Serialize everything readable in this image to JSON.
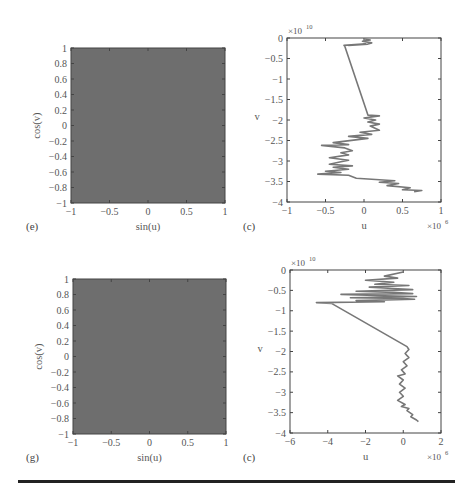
{
  "chart_data": [
    {
      "id": "e",
      "panel_label": "(e)",
      "type": "heatmap",
      "description": "Densely filled square (uniform gray) — points (sin(u), cos(v)) covering the whole square",
      "xlabel": "sin(u)",
      "ylabel": "cos(v)",
      "xlim": [
        -1,
        1
      ],
      "ylim": [
        -1,
        1
      ],
      "xticks": [
        -1,
        -0.5,
        0,
        0.5,
        1
      ],
      "xtick_labels": [
        "−1",
        "−0.5",
        "0",
        "0.5",
        "1"
      ],
      "yticks": [
        1,
        0.8,
        0.6,
        0.4,
        0.2,
        0,
        -0.2,
        -0.4,
        -0.6,
        -0.8,
        -1
      ],
      "ytick_labels": [
        "1",
        "0.8",
        "0.6",
        "0.4",
        "0.2",
        "0",
        "−0.2",
        "−0.4",
        "−0.6",
        "−0.8",
        "−1"
      ],
      "fill_color": "#6e6e6e",
      "frame": {
        "x": 71,
        "y": 48,
        "w": 154,
        "h": 155
      }
    },
    {
      "id": "c1",
      "panel_label": "(c)",
      "type": "line",
      "xlabel": "u",
      "ylabel": "v",
      "x_multiplier": "×10",
      "x_multiplier_exp": "6",
      "y_multiplier": "×10",
      "y_multiplier_exp": "10",
      "xlim": [
        -1,
        1
      ],
      "ylim": [
        -4,
        0
      ],
      "xticks": [
        -1,
        -0.5,
        0,
        0.5,
        1
      ],
      "xtick_labels": [
        "−1",
        "−0.5",
        "0",
        "0.5",
        "1"
      ],
      "yticks": [
        0,
        -0.5,
        -1,
        -1.5,
        -2,
        -2.5,
        -3,
        -3.5,
        -4
      ],
      "ytick_labels": [
        "0",
        "−0.5",
        "−1",
        "−1.5",
        "−2",
        "−2.5",
        "−3",
        "−3.5",
        "−4"
      ],
      "line_color": "#777777",
      "frame": {
        "x": 287,
        "y": 38,
        "w": 154,
        "h": 164
      },
      "series": [
        {
          "name": "trajectory",
          "x": [
            0.0,
            0.08,
            -0.02,
            0.1,
            0.05,
            -0.2,
            0.02,
            -0.26,
            -0.25,
            0.05,
            0.2,
            0.0,
            0.15,
            0.05,
            0.2,
            0.08,
            0.2,
            -0.05,
            0.1,
            -0.2,
            0.05,
            -0.4,
            -0.2,
            -0.55,
            -0.25,
            -0.15,
            -0.3,
            -0.2,
            -0.45,
            -0.2,
            -0.3,
            -0.45,
            -0.15,
            -0.4,
            -0.2,
            -0.5,
            -0.3,
            -0.6,
            -0.2,
            -0.1,
            0.4,
            0.2,
            0.45,
            0.3,
            0.6,
            0.5,
            0.75,
            0.65
          ],
          "y": [
            -0.02,
            -0.05,
            -0.08,
            -0.12,
            -0.15,
            -0.18,
            -0.14,
            -0.18,
            -0.2,
            -1.88,
            -1.9,
            -1.95,
            -2.0,
            -2.05,
            -2.1,
            -2.15,
            -2.25,
            -2.3,
            -2.35,
            -2.4,
            -2.45,
            -2.55,
            -2.6,
            -2.62,
            -2.68,
            -2.75,
            -2.8,
            -2.85,
            -2.92,
            -2.98,
            -3.02,
            -3.08,
            -3.12,
            -3.15,
            -3.2,
            -3.25,
            -3.28,
            -3.32,
            -3.35,
            -3.42,
            -3.48,
            -3.52,
            -3.55,
            -3.6,
            -3.65,
            -3.7,
            -3.72,
            -3.75
          ]
        }
      ]
    },
    {
      "id": "g",
      "panel_label": "(g)",
      "type": "heatmap",
      "description": "Densely filled square (uniform gray) — points (sin(u), cos(v)) covering the whole square",
      "xlabel": "sin(u)",
      "ylabel": "cos(v)",
      "xlim": [
        -1,
        1
      ],
      "ylim": [
        -1,
        1
      ],
      "xticks": [
        -1,
        -0.5,
        0,
        0.5,
        1
      ],
      "xtick_labels": [
        "−1",
        "−0.5",
        "0",
        "0.5",
        "1"
      ],
      "yticks": [
        1,
        0.8,
        0.6,
        0.4,
        0.2,
        0,
        -0.2,
        -0.4,
        -0.6,
        -0.8,
        -1
      ],
      "ytick_labels": [
        "1",
        "0.8",
        "0.6",
        "0.4",
        "0.2",
        "0",
        "−0.2",
        "−0.4",
        "−0.6",
        "−0.8",
        "−1"
      ],
      "fill_color": "#6e6e6e",
      "frame": {
        "x": 73,
        "y": 279,
        "w": 153,
        "h": 155
      }
    },
    {
      "id": "c2",
      "panel_label": "(c)",
      "type": "line",
      "xlabel": "u",
      "ylabel": "v",
      "x_multiplier": "×10",
      "x_multiplier_exp": "6",
      "y_multiplier": "×10",
      "y_multiplier_exp": "10",
      "xlim": [
        -6,
        2
      ],
      "ylim": [
        -4,
        0
      ],
      "xticks": [
        -6,
        -4,
        -2,
        0,
        2
      ],
      "xtick_labels": [
        "−6",
        "−4",
        "−2",
        "0",
        "2"
      ],
      "yticks": [
        0,
        -0.5,
        -1,
        -1.5,
        -2,
        -2.5,
        -3,
        -3.5,
        -4
      ],
      "ytick_labels": [
        "0",
        "−0.5",
        "−1",
        "−1.5",
        "−2",
        "−2.5",
        "−3",
        "−3.5",
        "−4"
      ],
      "line_color": "#777777",
      "frame": {
        "x": 290,
        "y": 270,
        "w": 151,
        "h": 163
      },
      "series": [
        {
          "name": "trajectory",
          "x": [
            0.0,
            -1.0,
            -0.3,
            -2.0,
            -0.5,
            -1.5,
            0.3,
            -1.8,
            -0.8,
            0.5,
            -2.5,
            -0.5,
            0.5,
            -3.3,
            -1.0,
            0.7,
            -2.8,
            0.0,
            0.6,
            -2.5,
            -1.0,
            -4.6,
            -3.8,
            0.2,
            0.3,
            0.1,
            0.3,
            0.0,
            0.2,
            -0.1,
            0.1,
            -0.3,
            0.0,
            -0.2,
            0.1,
            -0.2,
            0.0,
            -0.3,
            0.1,
            -0.1,
            0.3,
            0.2,
            0.5,
            0.4,
            0.7,
            0.8
          ],
          "y": [
            -0.05,
            -0.15,
            -0.2,
            -0.25,
            -0.3,
            -0.35,
            -0.38,
            -0.42,
            -0.45,
            -0.48,
            -0.52,
            -0.55,
            -0.58,
            -0.6,
            -0.63,
            -0.65,
            -0.68,
            -0.7,
            -0.72,
            -0.75,
            -0.78,
            -0.8,
            -0.82,
            -1.88,
            -1.95,
            -2.05,
            -2.15,
            -2.25,
            -2.35,
            -2.45,
            -2.55,
            -2.6,
            -2.7,
            -2.8,
            -2.9,
            -3.0,
            -3.1,
            -3.2,
            -3.3,
            -3.35,
            -3.4,
            -3.45,
            -3.55,
            -3.6,
            -3.68,
            -3.72
          ]
        }
      ]
    }
  ],
  "figure": {
    "rule_color": "#222222",
    "background": "#ffffff"
  }
}
